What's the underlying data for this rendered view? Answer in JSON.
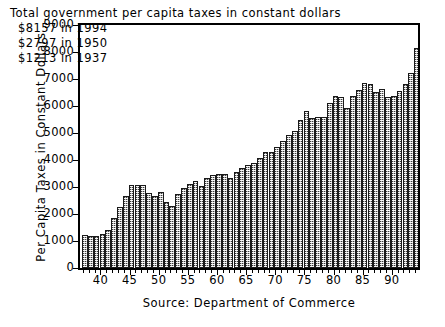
{
  "chart_data": {
    "type": "bar",
    "title": "Total government per capita taxes in constant dollars",
    "xlabel": "",
    "ylabel": "Per Capita Taxes in Constant Dollars",
    "source": "Source: Department of Commerce",
    "ylim": [
      0,
      9000
    ],
    "ytick_values": [
      9000,
      8000,
      7000,
      6000,
      5000,
      4000,
      3000,
      2000,
      1000,
      0
    ],
    "ytick_labels": [
      "9000",
      "8000",
      "7000",
      "6000",
      "5000",
      "4000",
      "3000",
      "2000",
      "1000",
      "0"
    ],
    "xlim": [
      1936.5,
      1994.5
    ],
    "xtick_values": [
      40,
      45,
      50,
      55,
      60,
      65,
      70,
      75,
      80,
      85,
      90
    ],
    "xtick_labels": [
      "40",
      "45",
      "50",
      "55",
      "60",
      "65",
      "70",
      "75",
      "80",
      "85",
      "90"
    ],
    "grid": false,
    "legend": false,
    "bar_fill_color": "#b9b9b9",
    "bar_edge_color": "#1a1a1a",
    "categories": [
      1937,
      1938,
      1939,
      1940,
      1941,
      1942,
      1943,
      1944,
      1945,
      1946,
      1947,
      1948,
      1949,
      1950,
      1951,
      1952,
      1953,
      1954,
      1955,
      1956,
      1957,
      1958,
      1959,
      1960,
      1961,
      1962,
      1963,
      1964,
      1965,
      1966,
      1967,
      1968,
      1969,
      1970,
      1971,
      1972,
      1973,
      1974,
      1975,
      1976,
      1977,
      1978,
      1979,
      1980,
      1981,
      1982,
      1983,
      1984,
      1985,
      1986,
      1987,
      1988,
      1989,
      1990,
      1991,
      1992,
      1993,
      1994
    ],
    "values": [
      1213,
      1190,
      1195,
      1260,
      1400,
      1850,
      2250,
      2650,
      3060,
      3090,
      3080,
      2760,
      2650,
      2797,
      2430,
      2300,
      2740,
      2970,
      3110,
      3230,
      3030,
      3340,
      3440,
      3480,
      3500,
      3340,
      3540,
      3700,
      3810,
      3900,
      4080,
      4290,
      4310,
      4490,
      4700,
      4910,
      5060,
      5470,
      5830,
      5570,
      5580,
      5600,
      6110,
      6370,
      6320,
      5940,
      6380,
      6610,
      6840,
      6810,
      6510,
      6630,
      6340,
      6370,
      6570,
      6820,
      7240,
      8157
    ],
    "annotations": {
      "headline": "Total government per capita taxes in constant dollars",
      "lines": [
        {
          "amount": "$8157",
          "text": " in 1994",
          "full": "$8157 in 1994"
        },
        {
          "amount": "$2797",
          "text": " in 1950",
          "full": "$2797 in 1950"
        },
        {
          "amount": "$1213",
          "text": " in 1937",
          "full": "$1213 in 1937"
        }
      ]
    }
  },
  "axes": {
    "ylabel": "Per Capita Taxes in Constant Dollars",
    "source_caption": "Source: Department of Commerce"
  }
}
